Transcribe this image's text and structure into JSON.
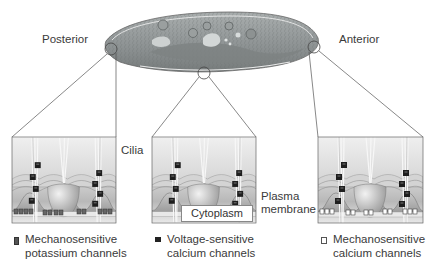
{
  "labels": {
    "posterior": "Posterior",
    "anterior": "Anterior",
    "cilia": "Cilia",
    "plasma_membrane_line1": "Plasma",
    "plasma_membrane_line2": "membrane",
    "cytoplasm": "Cytoplasm"
  },
  "legend": [
    {
      "symbol": "mechanosensitive-potassium-channel-icon",
      "line1": "Mechanosensitive",
      "line2": "potassium channels"
    },
    {
      "symbol": "voltage-sensitive-calcium-channel-icon",
      "line1": "Voltage-sensitive",
      "line2": "calcium channels"
    },
    {
      "symbol": "mechanosensitive-calcium-channel-icon",
      "line1": "Mechanosensitive",
      "line2": "calcium channels"
    }
  ],
  "panels": [
    {
      "id": "posterior-panel",
      "region": "Posterior",
      "membrane_channels": "mechanosensitive potassium"
    },
    {
      "id": "middle-panel",
      "region": "Middle",
      "membrane_channels": "none"
    },
    {
      "id": "anterior-panel",
      "region": "Anterior",
      "membrane_channels": "mechanosensitive calcium"
    }
  ],
  "colors": {
    "line": "#555555",
    "cell_body": "#8a8f8e",
    "panel_bg": "#e6e6e6"
  }
}
